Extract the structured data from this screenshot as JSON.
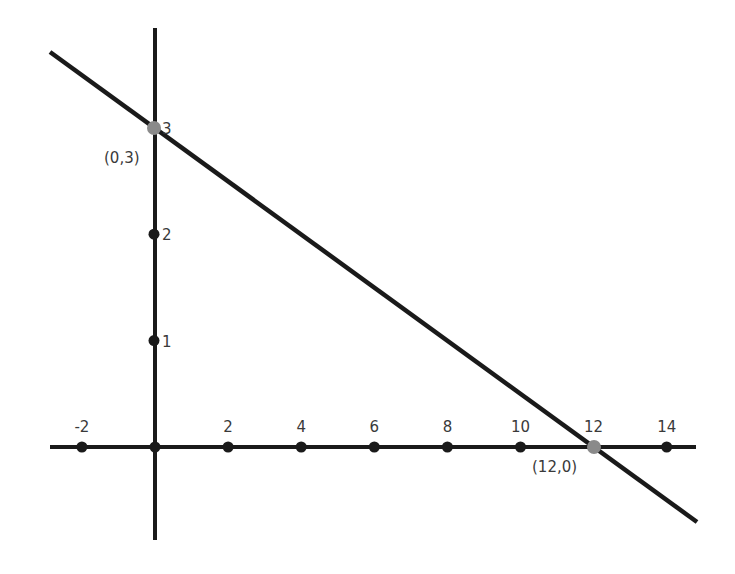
{
  "chart_data": {
    "type": "line",
    "title": "",
    "xlabel": "",
    "ylabel": "",
    "xlim": [
      -3,
      14.8
    ],
    "ylim": [
      -0.87,
      3.9
    ],
    "grid": false,
    "legend": null,
    "x_ticks": [
      -2,
      0,
      2,
      4,
      6,
      8,
      10,
      12,
      14
    ],
    "x_tick_labels": [
      "-2",
      "",
      "2",
      "4",
      "6",
      "8",
      "10",
      "12",
      "14"
    ],
    "y_ticks": [
      1,
      2,
      3
    ],
    "y_tick_labels": [
      "1",
      "2",
      "3"
    ],
    "series": [
      {
        "name": "line",
        "equation": "y = 3 - x/4",
        "x": [
          -2.86,
          14.92
        ],
        "y": [
          3.72,
          -0.71
        ],
        "color": "#1a1a1a"
      }
    ],
    "highlighted_points": [
      {
        "x": 0,
        "y": 3,
        "label": "(0,3)",
        "color": "#8a8a8a"
      },
      {
        "x": 12,
        "y": 0,
        "label": "(12,0)",
        "color": "#8a8a8a"
      }
    ],
    "annotations": [
      "(0,3)",
      "(12,0)"
    ]
  },
  "colors": {
    "axis": "#1a1a1a",
    "line": "#1a1a1a",
    "tick_dot": "#1a1a1a",
    "intercept_dot": "#8a8a8a",
    "text": "#3a3a3a"
  }
}
